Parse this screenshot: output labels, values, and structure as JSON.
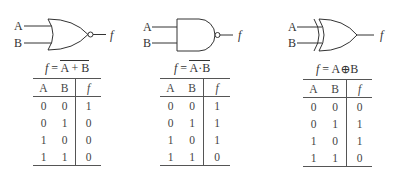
{
  "gates": [
    {
      "type": "NOR",
      "inputs": [
        "A",
        "B"
      ],
      "output": "f",
      "expression": {
        "lhs": "f",
        "eq": "=",
        "rhs": "A + B",
        "overline": true
      },
      "table": {
        "headers": [
          "A",
          "B",
          "f"
        ],
        "rows": [
          [
            "0",
            "0",
            "1"
          ],
          [
            "0",
            "1",
            "0"
          ],
          [
            "1",
            "0",
            "0"
          ],
          [
            "1",
            "1",
            "0"
          ]
        ]
      }
    },
    {
      "type": "NAND",
      "inputs": [
        "A",
        "B"
      ],
      "output": "f",
      "expression": {
        "lhs": "f",
        "eq": "=",
        "rhs": "A·B",
        "overline": true
      },
      "table": {
        "headers": [
          "A",
          "B",
          "f"
        ],
        "rows": [
          [
            "0",
            "0",
            "1"
          ],
          [
            "0",
            "1",
            "1"
          ],
          [
            "1",
            "0",
            "1"
          ],
          [
            "1",
            "1",
            "0"
          ]
        ]
      }
    },
    {
      "type": "XOR",
      "inputs": [
        "A",
        "B"
      ],
      "output": "f",
      "expression": {
        "lhs": "f",
        "eq": "=",
        "rhs": "A⊕B",
        "overline": false
      },
      "table": {
        "headers": [
          "A",
          "B",
          "f"
        ],
        "rows": [
          [
            "0",
            "0",
            "0"
          ],
          [
            "0",
            "1",
            "1"
          ],
          [
            "1",
            "0",
            "1"
          ],
          [
            "1",
            "1",
            "0"
          ]
        ]
      }
    }
  ]
}
